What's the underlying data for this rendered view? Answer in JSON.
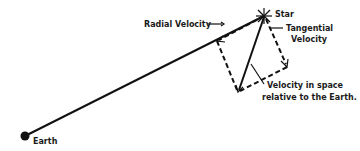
{
  "diagram": {
    "labels": {
      "star": "Star",
      "radial_velocity": "Radial Velocity",
      "tangential_velocity_line1": "Tangential",
      "tangential_velocity_line2": "Velocity",
      "space_velocity_line1": "Velocity in space",
      "space_velocity_line2": "relative to the Earth.",
      "earth": "Earth"
    },
    "points": {
      "earth": [
        25,
        136
      ],
      "star": [
        264,
        16
      ],
      "radial_tip": [
        217,
        41
      ],
      "tangential_tip": [
        287,
        67
      ],
      "space_velocity_tip": [
        238,
        92
      ]
    },
    "colors": {
      "ink": "#111111",
      "background": "#ffffff"
    }
  }
}
